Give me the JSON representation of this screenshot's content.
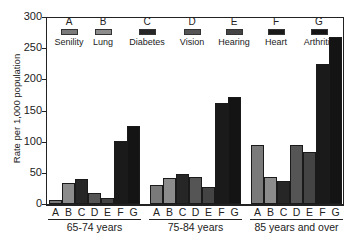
{
  "chart_data": {
    "type": "bar",
    "title": "",
    "xlabel": "",
    "ylabel": "Rate per 1,000 population",
    "ylim": [
      0,
      300
    ],
    "yticks": [
      0,
      50,
      100,
      150,
      200,
      250,
      300
    ],
    "grid": false,
    "legend_position": "top-inside",
    "categories": [
      "65-74 years",
      "75-84 years",
      "85 years and over"
    ],
    "bar_letters": [
      "A",
      "B",
      "C",
      "D",
      "E",
      "F",
      "G"
    ],
    "series": [
      {
        "letter": "A",
        "name": "Senility",
        "color": "#7a7a7a",
        "values": [
          6,
          30,
          95
        ]
      },
      {
        "letter": "B",
        "name": "Lung",
        "color": "#8c8c8c",
        "values": [
          34,
          41,
          43
        ]
      },
      {
        "letter": "C",
        "name": "Diabetes",
        "color": "#262626",
        "values": [
          40,
          48,
          37
        ]
      },
      {
        "letter": "D",
        "name": "Vision",
        "color": "#555555",
        "values": [
          18,
          44,
          95
        ]
      },
      {
        "letter": "E",
        "name": "Hearing",
        "color": "#444444",
        "values": [
          10,
          27,
          84
        ]
      },
      {
        "letter": "F",
        "name": "Heart",
        "color": "#1a1a1a",
        "values": [
          101,
          162,
          225
        ]
      },
      {
        "letter": "G",
        "name": "Arthritis",
        "color": "#141414",
        "values": [
          125,
          171,
          268
        ]
      }
    ]
  }
}
